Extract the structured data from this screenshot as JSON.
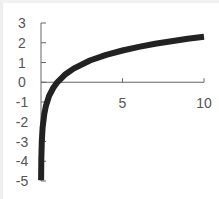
{
  "chart_data": {
    "type": "line",
    "title": "",
    "xlabel": "",
    "ylabel": "",
    "xlim": [
      0,
      10
    ],
    "ylim": [
      -5,
      3
    ],
    "x_ticks": [
      "5",
      "10"
    ],
    "y_ticks": [
      "3",
      "2",
      "1",
      "0",
      "-1",
      "-2",
      "-3",
      "-4",
      "-5"
    ],
    "grid": false,
    "legend": null,
    "series": [
      {
        "name": "y = ln(x)",
        "color": "#222222",
        "x": [
          0.007,
          0.02,
          0.05,
          0.1,
          0.2,
          0.3,
          0.5,
          0.75,
          1,
          1.5,
          2,
          3,
          4,
          5,
          6,
          7,
          8,
          9,
          10
        ],
        "y": [
          -4.96,
          -3.91,
          -3.0,
          -2.3,
          -1.61,
          -1.2,
          -0.69,
          -0.29,
          0,
          0.41,
          0.69,
          1.1,
          1.39,
          1.61,
          1.79,
          1.95,
          2.08,
          2.2,
          2.3
        ]
      }
    ]
  }
}
